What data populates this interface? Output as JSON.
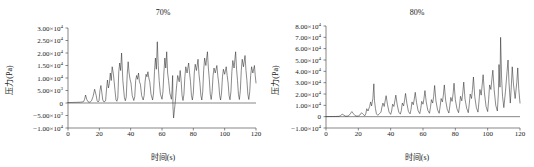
{
  "figure": {
    "panels": [
      {
        "id": "left",
        "title": "70%",
        "xlabel": "时间(s)",
        "ylabel": "压力(Pa)",
        "ytick_labels": [
          "3.00×10",
          "2.50×10",
          "2.00×10",
          "1.50×10",
          "1.00×10",
          "5.00×10",
          "0",
          "−5.00×10",
          "−1.00×10"
        ],
        "ytick_exps": [
          "4",
          "4",
          "4",
          "4",
          "4",
          "3",
          "",
          "3",
          "4"
        ],
        "ytick_values": [
          30000,
          25000,
          20000,
          15000,
          10000,
          5000,
          0,
          -5000,
          -10000
        ],
        "xtick_labels": [
          "0",
          "20",
          "40",
          "60",
          "80",
          "100",
          "120"
        ],
        "xtick_values": [
          0,
          20,
          40,
          60,
          80,
          100,
          120
        ]
      },
      {
        "id": "right",
        "title": "80%",
        "xlabel": "时间(s)",
        "ylabel": "压力(Pa)",
        "ytick_labels": [
          "8.00×10",
          "7.00×10",
          "6.00×10",
          "5.00×10",
          "4.00×10",
          "3.00×10",
          "2.00×10",
          "1.00×10",
          "0",
          "−1.00×10"
        ],
        "ytick_exps": [
          "4",
          "4",
          "4",
          "4",
          "4",
          "4",
          "4",
          "4",
          "",
          "4"
        ],
        "ytick_values": [
          80000,
          70000,
          60000,
          50000,
          40000,
          30000,
          20000,
          10000,
          0,
          -10000
        ],
        "xtick_labels": [
          "0",
          "20",
          "40",
          "60",
          "80",
          "100",
          "120"
        ],
        "xtick_values": [
          0,
          20,
          40,
          60,
          80,
          100,
          120
        ]
      }
    ]
  },
  "chart_data": [
    {
      "type": "line",
      "title": "70%",
      "xlabel": "时间(s)",
      "ylabel": "压力(Pa)",
      "xlim": [
        0,
        120
      ],
      "ylim": [
        -10000,
        30000
      ],
      "grid": false,
      "legend": "none",
      "series": [
        {
          "name": "压力",
          "x": [
            0,
            1,
            2,
            3,
            4,
            5,
            6,
            7,
            8,
            9,
            10,
            10.6,
            11.2,
            12,
            12.8,
            13.4,
            14,
            15,
            16,
            17,
            18,
            18.6,
            19.2,
            19.8,
            20.4,
            21,
            21.6,
            22.2,
            23,
            24,
            24.6,
            25.2,
            25.8,
            26.4,
            27,
            27.6,
            28.2,
            29,
            30,
            30.6,
            31.2,
            31.8,
            32.4,
            33,
            33.6,
            34.2,
            35,
            36,
            36.6,
            37.2,
            37.8,
            38.4,
            39,
            39.6,
            40.2,
            41,
            42,
            42.6,
            43.2,
            43.8,
            44.4,
            45,
            45.6,
            46.2,
            47,
            48,
            48.6,
            49.2,
            49.8,
            50.4,
            51,
            51.6,
            52.2,
            53,
            54,
            54.6,
            55.2,
            55.8,
            56.4,
            57,
            57.6,
            58.2,
            59,
            60,
            60.6,
            61.2,
            61.8,
            62.4,
            63,
            63.6,
            64.2,
            65,
            66,
            66.4,
            66.8,
            67,
            67.4,
            68,
            68.6,
            69.2,
            70,
            71,
            71.6,
            72.2,
            72.8,
            73.4,
            74,
            74.6,
            75.2,
            76,
            77,
            77.6,
            78.2,
            78.8,
            79.4,
            80,
            80.6,
            81.2,
            82,
            83,
            83.6,
            84.2,
            84.8,
            85.4,
            86,
            86.6,
            87.2,
            88,
            89,
            89.6,
            90.2,
            90.8,
            91.4,
            92,
            92.6,
            93.2,
            94,
            95,
            95.6,
            96.2,
            96.8,
            97.4,
            98,
            98.6,
            99.2,
            100,
            101,
            101.6,
            102.2,
            102.8,
            103.4,
            104,
            104.6,
            105.2,
            106,
            107,
            107.6,
            108.2,
            108.8,
            109.4,
            110,
            110.6,
            111.2,
            112,
            113,
            113.6,
            114.2,
            114.8,
            115.4,
            116,
            116.6,
            117.2,
            118,
            119,
            119.5,
            120
          ],
          "y": [
            200,
            180,
            220,
            200,
            260,
            240,
            300,
            280,
            350,
            400,
            600,
            1500,
            3200,
            1400,
            500,
            350,
            300,
            900,
            2600,
            5500,
            3000,
            900,
            400,
            900,
            5000,
            7000,
            4200,
            1200,
            400,
            900,
            5600,
            9200,
            6000,
            7800,
            12000,
            9000,
            14500,
            11500,
            5000,
            1300,
            700,
            2000,
            12500,
            16000,
            13000,
            20000,
            9000,
            2200,
            900,
            2500,
            11500,
            16500,
            12000,
            9500,
            8000,
            3000,
            1000,
            2500,
            9000,
            11000,
            9500,
            12000,
            8500,
            7500,
            3000,
            1200,
            3000,
            8500,
            11500,
            10500,
            12500,
            10000,
            8500,
            3500,
            1200,
            4000,
            12500,
            18000,
            13500,
            24500,
            15000,
            9000,
            3500,
            1500,
            4500,
            12000,
            18000,
            14000,
            20500,
            12000,
            9000,
            4000,
            1500,
            5000,
            11000,
            -1500,
            -6000,
            -2500,
            1200,
            6000,
            11000,
            8500,
            13000,
            9000,
            3000,
            1000,
            3500,
            10500,
            14500,
            12000,
            16000,
            12000,
            8500,
            3000,
            1200,
            4000,
            12000,
            15500,
            13000,
            17500,
            11500,
            8000,
            3000,
            1200,
            4500,
            13000,
            18000,
            15000,
            20500,
            14000,
            9500,
            3500,
            1400,
            4500,
            11000,
            14000,
            12000,
            15000,
            11000,
            8000,
            3000,
            1200,
            4000,
            10500,
            13500,
            11500,
            14500,
            11000,
            8000,
            3000,
            1300,
            4500,
            12500,
            17000,
            14000,
            20500,
            13500,
            9000,
            3500,
            1400,
            5000,
            13000,
            17500,
            14500,
            19000,
            13000,
            9000,
            3500,
            1400,
            4500,
            11000,
            14500,
            12000,
            15000,
            11000,
            8000,
            3000,
            1200,
            4200,
            11000,
            13000,
            9000
          ]
        }
      ]
    },
    {
      "type": "line",
      "title": "80%",
      "xlabel": "时间(s)",
      "ylabel": "压力(Pa)",
      "xlim": [
        0,
        120
      ],
      "ylim": [
        -10000,
        80000
      ],
      "grid": false,
      "legend": "none",
      "series": [
        {
          "name": "压力",
          "x": [
            0,
            2,
            4,
            6,
            8,
            9,
            10,
            11,
            12,
            13,
            14,
            15,
            16,
            17,
            18,
            19,
            20,
            21,
            22,
            23,
            24,
            24.6,
            25.2,
            26,
            27,
            27.6,
            28.2,
            29,
            29.6,
            30,
            30.6,
            31.2,
            32,
            33,
            34,
            34.6,
            35.2,
            36,
            36.6,
            37.2,
            38,
            39,
            40,
            40.6,
            41.2,
            42,
            42.6,
            43.2,
            44,
            45,
            46,
            46.6,
            47.2,
            48,
            48.6,
            49.2,
            50,
            51,
            52,
            52.6,
            53.2,
            54,
            54.6,
            55.2,
            56,
            57,
            58,
            58.6,
            59.2,
            60,
            60.6,
            61.2,
            62,
            63,
            64,
            64.6,
            65.2,
            66,
            66.6,
            67.2,
            68,
            69,
            70,
            70.6,
            71.2,
            72,
            72.6,
            73.2,
            74,
            75,
            76,
            76.6,
            77.2,
            78,
            78.6,
            79.2,
            80,
            81,
            82,
            82.6,
            83.2,
            84,
            84.6,
            85.2,
            86,
            87,
            88,
            88.6,
            89.2,
            90,
            90.6,
            91.2,
            92,
            93,
            94,
            94.6,
            95.2,
            96,
            96.6,
            97.2,
            98,
            99,
            100,
            100.6,
            101.2,
            102,
            102.6,
            103.2,
            104,
            105,
            106,
            106.6,
            107,
            107.6,
            108,
            108.6,
            109.2,
            110,
            111,
            112,
            112.6,
            113.2,
            114,
            114.6,
            115.2,
            116,
            117,
            118,
            118.6,
            119.2,
            120
          ],
          "y": [
            100,
            150,
            120,
            200,
            300,
            900,
            2200,
            1400,
            500,
            400,
            800,
            2500,
            4500,
            2600,
            900,
            500,
            600,
            1500,
            3500,
            2000,
            800,
            2500,
            7000,
            5000,
            9000,
            13000,
            9500,
            16000,
            29000,
            14000,
            7000,
            2500,
            1200,
            2500,
            4000,
            8500,
            12000,
            9000,
            14000,
            18500,
            11000,
            4000,
            2000,
            5000,
            11000,
            9000,
            14000,
            19000,
            11000,
            4000,
            2200,
            5500,
            12000,
            9500,
            14500,
            20500,
            12000,
            4500,
            2500,
            6500,
            13000,
            10500,
            15500,
            21500,
            12500,
            5000,
            2700,
            7000,
            13500,
            11000,
            16000,
            23000,
            13000,
            5500,
            3000,
            8000,
            15000,
            12000,
            18000,
            27500,
            14000,
            6000,
            3000,
            9000,
            16000,
            13000,
            19000,
            28000,
            14500,
            6500,
            3200,
            9500,
            17000,
            13500,
            20000,
            29500,
            15000,
            7000,
            3500,
            10000,
            18000,
            14000,
            21000,
            30500,
            15500,
            7500,
            3500,
            11000,
            20000,
            16000,
            24000,
            35000,
            18000,
            8000,
            4000,
            13000,
            24000,
            19000,
            28000,
            37000,
            21000,
            9000,
            4500,
            15000,
            28000,
            24000,
            33000,
            41000,
            24000,
            10000,
            5000,
            20000,
            46000,
            26000,
            70000,
            35000,
            18000,
            8000,
            22000,
            40000,
            50000,
            30000,
            12000,
            26000,
            44000,
            28000,
            16000,
            30000,
            43000,
            25000,
            12000,
            9000
          ]
        }
      ]
    }
  ]
}
